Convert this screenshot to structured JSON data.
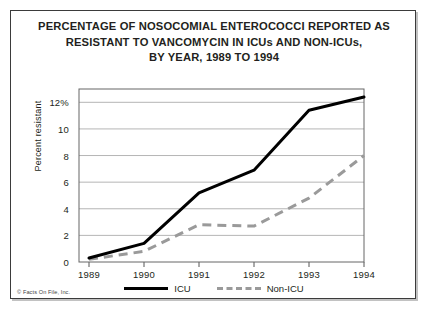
{
  "title": {
    "line1": "PERCENTAGE OF NOSOCOMIAL ENTEROCOCCI REPORTED AS",
    "line2": "RESISTANT TO VANCOMYCIN IN ICUs AND NON-ICUs,",
    "line3": "BY YEAR, 1989 TO 1994"
  },
  "credit": "© Facts On File, Inc.",
  "legend": {
    "icu_label": "ICU",
    "nonicu_label": "Non-ICU"
  },
  "colors": {
    "icu_line": "#000000",
    "nonicu_line": "#9a9a9a",
    "grid": "#b5b5b5",
    "axis": "#555555",
    "text": "#231f20",
    "frame": "#3b3b3b"
  },
  "chart_data": {
    "type": "line",
    "title": "PERCENTAGE OF NOSOCOMIAL ENTEROCOCCI REPORTED AS RESISTANT TO VANCOMYCIN IN ICUs AND NON-ICUs, BY YEAR, 1989 TO 1994",
    "xlabel": "",
    "ylabel": "Percent resistant",
    "x": [
      "1989",
      "1990",
      "1991",
      "1992",
      "1993",
      "1994"
    ],
    "xtick_labels": [
      "1989",
      "1990",
      "1991",
      "1992",
      "1993",
      "1994"
    ],
    "ytick_labels": [
      "0",
      "2",
      "4",
      "6",
      "8",
      "10",
      "12%"
    ],
    "ytick_values": [
      0,
      2,
      4,
      6,
      8,
      10,
      12
    ],
    "ylim": [
      0,
      13
    ],
    "grid": true,
    "legend_position": "bottom",
    "series": [
      {
        "name": "ICU",
        "style": "solid",
        "color": "#000000",
        "values": [
          0.3,
          1.4,
          5.2,
          6.9,
          11.4,
          12.4
        ]
      },
      {
        "name": "Non-ICU",
        "style": "dashed",
        "color": "#9a9a9a",
        "values": [
          0.2,
          0.8,
          2.8,
          2.7,
          4.8,
          8.0
        ]
      }
    ]
  }
}
